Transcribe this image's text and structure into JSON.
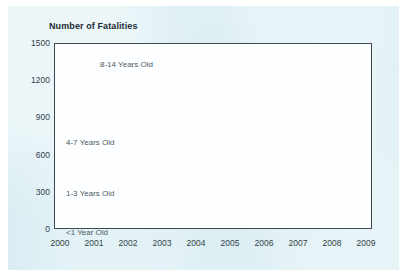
{
  "chart_data": {
    "type": "line",
    "title": "Number of Fatalities",
    "xlabel": "",
    "ylabel": "",
    "ylim": [
      0,
      1500
    ],
    "yticks": [
      0,
      300,
      600,
      900,
      1200,
      1500
    ],
    "ytick_labels": [
      "0",
      "300",
      "600",
      "900",
      "1200",
      "1500"
    ],
    "grid": true,
    "legend_position": "inline-labels",
    "categories": [
      "2000",
      "2001",
      "2002",
      "2003",
      "2004",
      "2005",
      "2006",
      "2007",
      "2008",
      "2009"
    ],
    "series": [
      {
        "name": "8-14 Years Old",
        "color": "#a8d5ea",
        "label_x": "2001",
        "values": [
          1225,
          1150,
          1120,
          1180,
          1175,
          1020,
          900,
          890,
          700,
          650
        ]
      },
      {
        "name": "4-7 Years Old",
        "color": "#7cb9e0",
        "label_x": "2000",
        "values": [
          570,
          540,
          480,
          475,
          490,
          460,
          445,
          390,
          320,
          330
        ]
      },
      {
        "name": "1-3 Years Old",
        "color": "#a3aab0",
        "label_x": "2000",
        "values": [
          435,
          395,
          375,
          360,
          395,
          355,
          340,
          320,
          250,
          270
        ]
      },
      {
        "name": "<1 Year Old",
        "color": "#0d0d0d",
        "label_x": "2000",
        "values": [
          135,
          125,
          115,
          125,
          120,
          110,
          120,
          105,
          85,
          70
        ]
      }
    ]
  },
  "figure": {
    "panel_color": "#d6ecf2",
    "plot_background": "#fdfeff",
    "axis_color": "#3d4a52",
    "gridline_color": "#dde8ef",
    "tick_label_color": "#33424a",
    "title_color": "#1b2b33",
    "series_label_color": "#4a5a63"
  }
}
